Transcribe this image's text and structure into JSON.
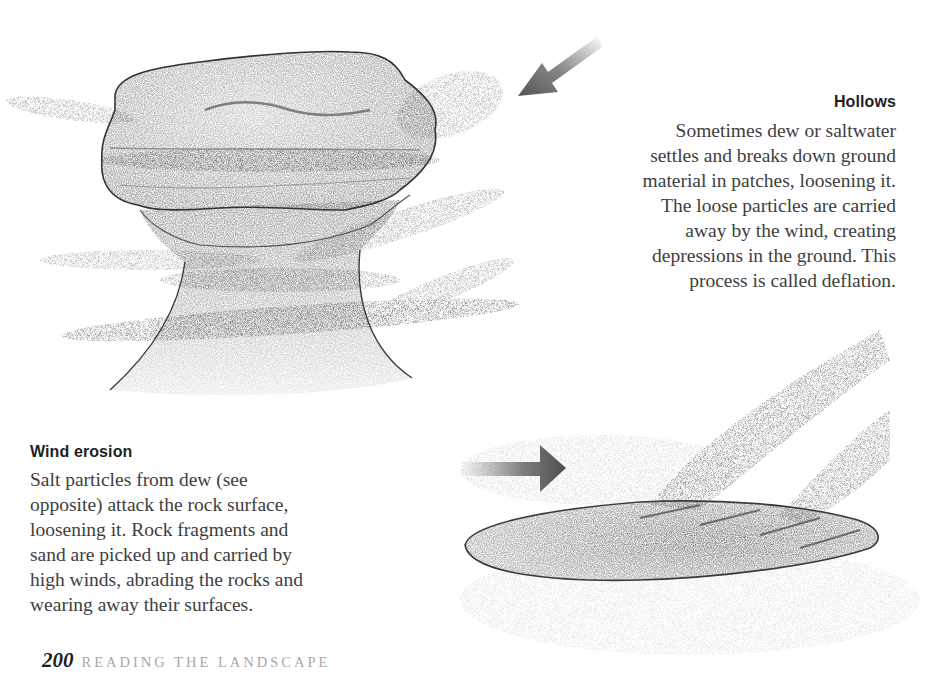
{
  "page": {
    "number": "200",
    "section_title": "READING THE LANDSCAPE"
  },
  "hollows": {
    "heading": "Hollows",
    "lines": [
      "Sometimes dew or saltwater",
      "settles and breaks down ground",
      "material in patches, loosening it.",
      "The loose particles are carried",
      "away by the wind, creating",
      "depressions in the ground. This",
      "process is called deflation."
    ]
  },
  "wind_erosion": {
    "heading": "Wind erosion",
    "lines": [
      "Salt particles from dew (see",
      "opposite) attack the rock surface,",
      "loosening it. Rock fragments and",
      "sand are picked up and carried by",
      "high winds, abrading the rocks and",
      "wearing away their surfaces."
    ]
  },
  "illustrations": {
    "mushroom_rock": "pencil drawing of a wind-eroded mushroom-shaped rock with bands of blowing sand",
    "deflation_hollow": "pencil drawing of an elliptical hollow with particles blown out by wind",
    "wind_arrow_diagonal": "arrow-down-left-icon",
    "wind_arrow_right": "arrow-right-icon"
  },
  "colors": {
    "background": "#ffffff",
    "body_text": "#3e3e3e",
    "heading_text": "#1f1f1f",
    "footer_section": "#a8a8a8",
    "arrow": "#555555"
  }
}
